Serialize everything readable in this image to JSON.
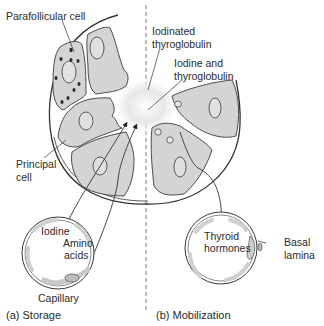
{
  "diagram": {
    "colors": {
      "cell_fill": "#d4d4d4",
      "outline": "#3a3a3a",
      "background": "#ffffff",
      "colloid": "#cfcfcf"
    },
    "labels": {
      "parafollicular_cell": "Parafollicular cell",
      "iodinated_thyroglobulin_1": "Iodinated",
      "iodinated_thyroglobulin_2": "thyroglobulin",
      "iodine_thyroglobulin_1": "Iodine and",
      "iodine_thyroglobulin_2": "thyroglobulin",
      "principal_cell_1": "Principal",
      "principal_cell_2": "cell",
      "iodine": "Iodine",
      "amino_acids_1": "Amino",
      "amino_acids_2": "acids",
      "capillary": "Capillary",
      "thyroid_hormones_1": "Thyroid",
      "thyroid_hormones_2": "hormones",
      "basal_lamina_1": "Basal",
      "basal_lamina_2": "lamina"
    },
    "panels": [
      {
        "id": "a",
        "caption": "(a) Storage"
      },
      {
        "id": "b",
        "caption": "(b) Mobilization"
      }
    ]
  }
}
